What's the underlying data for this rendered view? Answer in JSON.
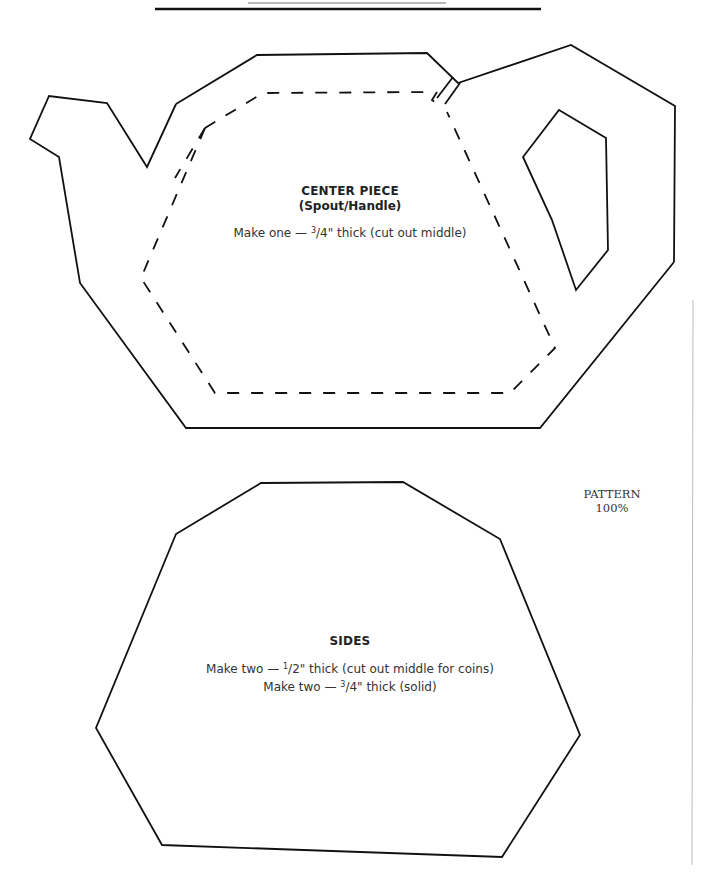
{
  "document": {
    "type": "woodworking pattern sheet",
    "line_color": "#111111",
    "rule_color_thin": "#777777",
    "page_edge_color": "#bbbbbb"
  },
  "center_piece": {
    "title": "CENTER PIECE",
    "subtitle": "(Spout/Handle)",
    "instruction_prefix": "Make one — ",
    "instruction_fraction_num": "3",
    "instruction_fraction_rest": "/4\" thick (cut out middle)"
  },
  "sides": {
    "title": "SIDES",
    "line1_prefix": "Make two — ",
    "line1_fraction_num": "1",
    "line1_fraction_rest": "/2\" thick (cut out middle for coins)",
    "line2_prefix": "Make two — ",
    "line2_fraction_num": "3",
    "line2_fraction_rest": "/4\" thick (solid)"
  },
  "pattern_note": {
    "line1": "PATTERN",
    "line2": "100%"
  }
}
